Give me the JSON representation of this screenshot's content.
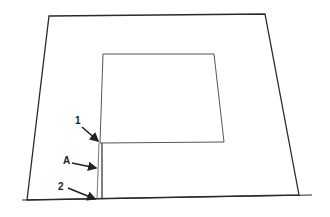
{
  "diagram": {
    "type": "technical-line-drawing",
    "colors": {
      "background": "#ffffff",
      "stroke": "#2a2a2a",
      "inner_stroke": "#555555",
      "label": "#222222"
    },
    "outer_panel": {
      "points": [
        [
          49,
          16
        ],
        [
          265,
          14
        ],
        [
          299,
          195
        ],
        [
          27,
          200
        ]
      ]
    },
    "baseline": {
      "x1": 22,
      "y1": 200,
      "x2": 312,
      "y2": 195
    },
    "inner_square": {
      "points": [
        [
          103,
          54
        ],
        [
          214,
          54
        ],
        [
          224,
          142
        ],
        [
          100,
          143
        ]
      ]
    },
    "vertical_lines": [
      {
        "name": "left-edge-extension",
        "x1": 99,
        "y1": 143,
        "x2": 97,
        "y2": 199
      },
      {
        "name": "right-line",
        "x1": 102,
        "y1": 143,
        "x2": 102,
        "y2": 199
      }
    ],
    "labels": [
      {
        "id": "label-1",
        "text": "1",
        "x": 75,
        "y": 124,
        "arrow": [
          82,
          127,
          98,
          141
        ]
      },
      {
        "id": "label-A",
        "text": "A",
        "x": 63,
        "y": 164,
        "arrow": [
          72,
          163,
          96,
          168
        ]
      },
      {
        "id": "label-2",
        "text": "2",
        "x": 58,
        "y": 190,
        "arrow": [
          68,
          188,
          95,
          199
        ]
      }
    ]
  }
}
